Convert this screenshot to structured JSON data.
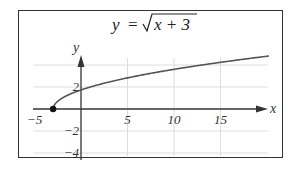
{
  "chart_data": {
    "type": "line",
    "title_parts": {
      "lhs": "y",
      "eq": "=",
      "radicand": "x + 3"
    },
    "xlabel": "x",
    "ylabel": "y",
    "xlim": [
      -6,
      20
    ],
    "ylim": [
      -5,
      6
    ],
    "x_ticks": [
      -5,
      5,
      10,
      15
    ],
    "x_tick_labels": [
      "−5",
      "5",
      "10",
      "15"
    ],
    "y_ticks": [
      2,
      -2,
      -4
    ],
    "y_tick_labels": [
      "2",
      "−2",
      "−4"
    ],
    "grid": true,
    "grid_x": [
      5,
      10,
      15
    ],
    "grid_y": [
      -4,
      -2,
      2,
      4
    ],
    "series": [
      {
        "name": "sqrt(x+3)",
        "function": "sqrt(x+3)",
        "x": [
          -3,
          -2,
          -1,
          0,
          1,
          2,
          4,
          6,
          8,
          10,
          12,
          14,
          16,
          18,
          20
        ],
        "y": [
          0,
          1,
          1.41,
          1.73,
          2,
          2.24,
          2.65,
          3,
          3.32,
          3.61,
          3.87,
          4.12,
          4.36,
          4.58,
          4.8
        ]
      }
    ],
    "annotations": [
      {
        "type": "point",
        "x": -3,
        "y": 0,
        "style": "filled-dot"
      }
    ],
    "colors": {
      "curve": "#555555",
      "axis": "#333333",
      "grid": "#dddddd",
      "frame": "#333333"
    }
  }
}
